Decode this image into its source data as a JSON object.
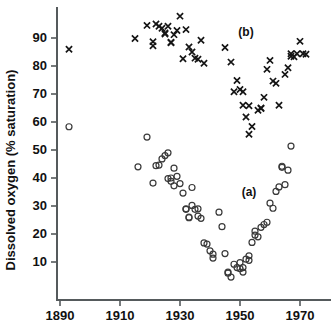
{
  "chart_data": {
    "type": "scatter",
    "title": "",
    "xlabel": "",
    "ylabel": "Dissolved oxygen (% saturation)",
    "xlim": [
      1885,
      1975
    ],
    "ylim": [
      0,
      97
    ],
    "grid": false,
    "legend_position": "inline-annotations",
    "x_ticks": [
      1890,
      1910,
      1930,
      1950,
      1970
    ],
    "y_ticks": [
      10,
      20,
      30,
      40,
      50,
      60,
      70,
      80,
      90
    ],
    "annotations": [
      {
        "text": "(a)",
        "x": 1953,
        "y": 35
      },
      {
        "text": "(b)",
        "x": 1952,
        "y": 92
      }
    ],
    "series": [
      {
        "name": "(b)",
        "marker": "cross",
        "label": "(b)",
        "points": [
          [
            1893,
            86.0
          ],
          [
            1915,
            89.8
          ],
          [
            1919,
            94.5
          ],
          [
            1921,
            88.7
          ],
          [
            1921,
            87.2
          ],
          [
            1922,
            95.0
          ],
          [
            1923,
            94.2
          ],
          [
            1924,
            93.5
          ],
          [
            1925,
            91.8
          ],
          [
            1925,
            91.4
          ],
          [
            1926,
            94.2
          ],
          [
            1927,
            88.5
          ],
          [
            1927,
            88.3
          ],
          [
            1928,
            91.2
          ],
          [
            1929,
            92.7
          ],
          [
            1930,
            97.8
          ],
          [
            1931,
            82.6
          ],
          [
            1932,
            93.0
          ],
          [
            1933,
            86.8
          ],
          [
            1934,
            85.0
          ],
          [
            1935,
            82.8
          ],
          [
            1936,
            82.4
          ],
          [
            1937,
            89.2
          ],
          [
            1938,
            81.0
          ],
          [
            1945,
            86.6
          ],
          [
            1947,
            81.4
          ],
          [
            1948,
            70.8
          ],
          [
            1949,
            74.8
          ],
          [
            1950,
            71.6
          ],
          [
            1951,
            70.8
          ],
          [
            1951,
            66.0
          ],
          [
            1952,
            61.8
          ],
          [
            1953,
            65.8
          ],
          [
            1953,
            55.6
          ],
          [
            1954,
            58.4
          ],
          [
            1956,
            64.2
          ],
          [
            1957,
            64.8
          ],
          [
            1957,
            65.0
          ],
          [
            1958,
            68.8
          ],
          [
            1959,
            78.8
          ],
          [
            1960,
            82.0
          ],
          [
            1961,
            74.6
          ],
          [
            1962,
            73.8
          ],
          [
            1963,
            66.0
          ],
          [
            1965,
            77.0
          ],
          [
            1966,
            79.4
          ],
          [
            1967,
            83.5
          ],
          [
            1967,
            84.4
          ],
          [
            1968,
            83.3
          ],
          [
            1969,
            84.4
          ],
          [
            1970,
            88.8
          ],
          [
            1971,
            84.4
          ],
          [
            1972,
            84.2
          ]
        ]
      },
      {
        "name": "(a)",
        "marker": "circle",
        "label": "(a)",
        "points": [
          [
            1893,
            58.3
          ],
          [
            1916,
            44.0
          ],
          [
            1919,
            54.6
          ],
          [
            1921,
            38.2
          ],
          [
            1922,
            44.4
          ],
          [
            1923,
            44.6
          ],
          [
            1924,
            46.8
          ],
          [
            1925,
            48.0
          ],
          [
            1926,
            49.0
          ],
          [
            1926,
            39.8
          ],
          [
            1927,
            38.8
          ],
          [
            1927,
            40.0
          ],
          [
            1928,
            43.5
          ],
          [
            1928,
            37.2
          ],
          [
            1929,
            40.6
          ],
          [
            1930,
            38.0
          ],
          [
            1931,
            34.6
          ],
          [
            1932,
            29.0
          ],
          [
            1932,
            28.8
          ],
          [
            1933,
            26.0
          ],
          [
            1933,
            25.8
          ],
          [
            1934,
            30.2
          ],
          [
            1934,
            36.6
          ],
          [
            1935,
            28.8
          ],
          [
            1936,
            29.0
          ],
          [
            1936,
            26.4
          ],
          [
            1937,
            25.6
          ],
          [
            1938,
            16.8
          ],
          [
            1939,
            16.4
          ],
          [
            1940,
            14.0
          ],
          [
            1941,
            12.8
          ],
          [
            1941,
            11.4
          ],
          [
            1943,
            27.8
          ],
          [
            1944,
            22.6
          ],
          [
            1945,
            13.0
          ],
          [
            1946,
            6.4
          ],
          [
            1946,
            6.0
          ],
          [
            1947,
            4.6
          ],
          [
            1948,
            9.2
          ],
          [
            1949,
            8.0
          ],
          [
            1950,
            9.8
          ],
          [
            1950,
            7.6
          ],
          [
            1951,
            8.0
          ],
          [
            1951,
            6.4
          ],
          [
            1952,
            11.0
          ],
          [
            1953,
            12.2
          ],
          [
            1953,
            10.6
          ],
          [
            1954,
            17.0
          ],
          [
            1955,
            19.6
          ],
          [
            1955,
            21.0
          ],
          [
            1956,
            19.0
          ],
          [
            1957,
            22.4
          ],
          [
            1958,
            23.4
          ],
          [
            1959,
            24.2
          ],
          [
            1960,
            31.0
          ],
          [
            1961,
            29.2
          ],
          [
            1962,
            35.2
          ],
          [
            1963,
            36.8
          ],
          [
            1964,
            43.8
          ],
          [
            1964,
            44.2
          ],
          [
            1965,
            37.6
          ],
          [
            1966,
            42.8
          ],
          [
            1967,
            51.4
          ]
        ]
      }
    ]
  }
}
